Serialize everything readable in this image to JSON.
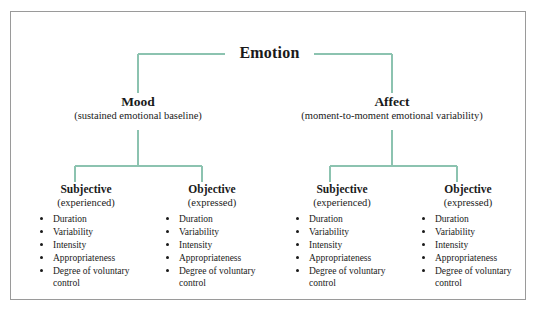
{
  "diagram": {
    "title": "Emotion",
    "line_color": "#8cc3b0",
    "frame_color": "#9a9a9a",
    "text_color": "#1a1a1a",
    "root": {
      "label": "Emotion"
    },
    "branches": [
      {
        "id": "mood",
        "label": "Mood",
        "subtitle": "(sustained emotional baseline)"
      },
      {
        "id": "affect",
        "label": "Affect",
        "subtitle": "(moment-to-moment emotional variability)"
      }
    ],
    "leaves": [
      {
        "id": "mood-subjective",
        "parent": "mood",
        "label": "Subjective",
        "subtitle": "(experienced)",
        "items": [
          "Duration",
          "Variability",
          "Intensity",
          "Appropriateness",
          "Degree of voluntary control"
        ]
      },
      {
        "id": "mood-objective",
        "parent": "mood",
        "label": "Objective",
        "subtitle": "(expressed)",
        "items": [
          "Duration",
          "Variability",
          "Intensity",
          "Appropriateness",
          "Degree of voluntary control"
        ]
      },
      {
        "id": "affect-subjective",
        "parent": "affect",
        "label": "Subjective",
        "subtitle": "(experienced)",
        "items": [
          "Duration",
          "Variability",
          "Intensity",
          "Appropriateness",
          "Degree of voluntary control"
        ]
      },
      {
        "id": "affect-objective",
        "parent": "affect",
        "label": "Objective",
        "subtitle": "(expressed)",
        "items": [
          "Duration",
          "Variability",
          "Intensity",
          "Appropriateness",
          "Degree of voluntary control"
        ]
      }
    ]
  }
}
